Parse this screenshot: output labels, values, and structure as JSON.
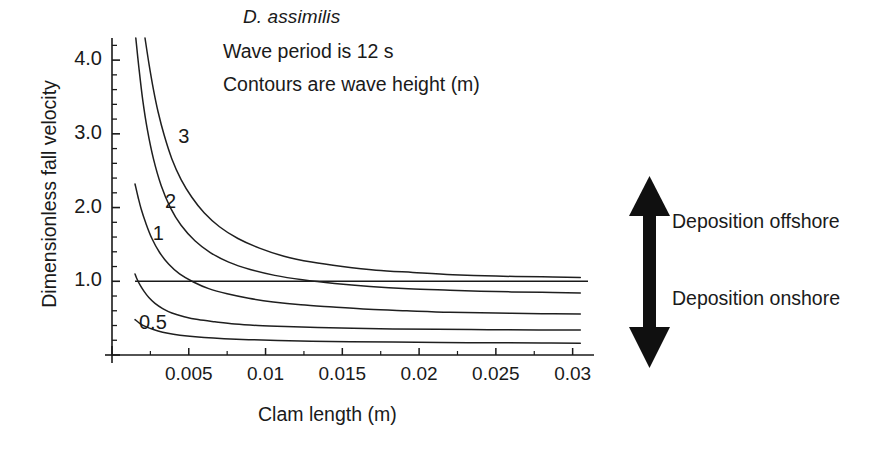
{
  "figure": {
    "title": "D. assimilis",
    "annotations": [
      "Wave period is 12 s",
      "Contours are wave height  (m)"
    ],
    "x_axis_title": "Clam length (m)",
    "y_axis_title": "Dimensionless fall velocity",
    "arrows": {
      "up_label": "Deposition offshore",
      "down_label": "Deposition onshore"
    }
  },
  "chart_data": {
    "type": "line",
    "title": "D. assimilis",
    "subtitle": "Wave period is 12 s | Contours are wave height  (m)",
    "xlabel": "Clam length (m)",
    "ylabel": "Dimensionless fall velocity",
    "xlim": [
      0.0,
      0.031
    ],
    "ylim": [
      0.0,
      4.3
    ],
    "x_ticks": [
      0.005,
      0.01,
      0.015,
      0.02,
      0.025,
      0.03
    ],
    "x_tick_labels": [
      "0.005",
      "0.01",
      "0.015",
      "0.02",
      "0.025",
      "0.03"
    ],
    "y_ticks": [
      1.0,
      2.0,
      3.0,
      4.0
    ],
    "y_tick_labels": [
      "1.0",
      "2.0",
      "3.0",
      "4.0"
    ],
    "x_minor_tick_step": 0.0025,
    "y_minor_tick_step": 0.2,
    "grid": false,
    "legend": "inline-contour-labels",
    "annotations": [
      {
        "text": "Wave period is 12 s",
        "x": 0.0075,
        "y": 3.85
      },
      {
        "text": "Contours are wave height  (m)",
        "x": 0.0075,
        "y": 3.45
      },
      {
        "text": "Deposition offshore",
        "x": 0.0385,
        "y": 1.85
      },
      {
        "text": "Deposition onshore",
        "x": 0.0385,
        "y": 0.8
      }
    ],
    "reference_lines": [
      {
        "orientation": "horizontal",
        "y": 1.0,
        "x_start": 0.0015,
        "x_end": 0.031,
        "label": "settling / suspension threshold"
      }
    ],
    "series": [
      {
        "name": "3",
        "label": "3",
        "label_position": {
          "x": 0.0047,
          "y": 2.95
        },
        "x": [
          0.00215,
          0.0024,
          0.0027,
          0.003,
          0.0034,
          0.0039,
          0.0045,
          0.0052,
          0.006,
          0.007,
          0.0082,
          0.0096,
          0.0112,
          0.013,
          0.015,
          0.0172,
          0.0196,
          0.0222,
          0.025,
          0.028,
          0.0305
        ],
        "y": [
          4.3,
          3.96,
          3.6,
          3.3,
          2.98,
          2.66,
          2.38,
          2.14,
          1.93,
          1.74,
          1.58,
          1.45,
          1.34,
          1.26,
          1.2,
          1.15,
          1.12,
          1.09,
          1.07,
          1.06,
          1.05
        ]
      },
      {
        "name": "2",
        "label": "2",
        "label_position": {
          "x": 0.00385,
          "y": 2.06
        },
        "x": [
          0.00155,
          0.00175,
          0.002,
          0.0023,
          0.0027,
          0.0032,
          0.0038,
          0.0045,
          0.0054,
          0.0064,
          0.0076,
          0.009,
          0.0106,
          0.0124,
          0.0145,
          0.0168,
          0.0193,
          0.022,
          0.025,
          0.028,
          0.0305
        ],
        "y": [
          4.3,
          3.9,
          3.46,
          3.06,
          2.66,
          2.3,
          2.0,
          1.76,
          1.55,
          1.39,
          1.26,
          1.16,
          1.08,
          1.02,
          0.97,
          0.93,
          0.9,
          0.88,
          0.86,
          0.85,
          0.84
        ]
      },
      {
        "name": "1",
        "label": "1",
        "label_position": {
          "x": 0.00305,
          "y": 1.63
        },
        "x": [
          0.0015,
          0.0017,
          0.0019,
          0.0022,
          0.0026,
          0.0031,
          0.0037,
          0.0044,
          0.0053,
          0.0063,
          0.0075,
          0.0089,
          0.0105,
          0.0123,
          0.0144,
          0.0167,
          0.0192,
          0.022,
          0.025,
          0.028,
          0.0305
        ],
        "y": [
          2.32,
          2.14,
          1.98,
          1.79,
          1.58,
          1.39,
          1.23,
          1.1,
          0.99,
          0.9,
          0.83,
          0.77,
          0.72,
          0.68,
          0.65,
          0.62,
          0.6,
          0.58,
          0.57,
          0.56,
          0.555
        ]
      },
      {
        "name": "0.5",
        "label": "0.5",
        "label_position": {
          "x": 0.00215,
          "y": 0.42
        },
        "x": [
          0.0015,
          0.00165,
          0.00185,
          0.0021,
          0.0024,
          0.0028,
          0.0033,
          0.0039,
          0.0047,
          0.0056,
          0.0067,
          0.008,
          0.0095,
          0.0113,
          0.0134,
          0.0157,
          0.0183,
          0.0212,
          0.0245,
          0.0278,
          0.0305
        ],
        "y": [
          1.1,
          1.02,
          0.94,
          0.86,
          0.78,
          0.7,
          0.63,
          0.57,
          0.52,
          0.48,
          0.45,
          0.42,
          0.4,
          0.385,
          0.372,
          0.362,
          0.354,
          0.348,
          0.343,
          0.34,
          0.338
        ]
      },
      {
        "name": "lowest",
        "label": "",
        "label_position": {
          "x": 0.0,
          "y": 0.0
        },
        "x": [
          0.0015,
          0.0018,
          0.0022,
          0.0027,
          0.0033,
          0.004,
          0.0049,
          0.006,
          0.0073,
          0.0089,
          0.0108,
          0.013,
          0.0155,
          0.0183,
          0.0214,
          0.0248,
          0.028,
          0.0305
        ],
        "y": [
          0.48,
          0.43,
          0.385,
          0.345,
          0.31,
          0.282,
          0.258,
          0.238,
          0.222,
          0.208,
          0.197,
          0.188,
          0.181,
          0.175,
          0.17,
          0.166,
          0.163,
          0.161
        ]
      }
    ]
  },
  "axes_geometry": {
    "plot_left_px": 112,
    "plot_right_px": 588,
    "plot_bottom_px": 355,
    "plot_top_px": 38,
    "x_value_at_left": 0.0,
    "x_value_at_right": 0.031,
    "y_value_at_bottom": 0.0,
    "y_value_at_top": 4.3
  },
  "y_tick_labels": [
    {
      "text": "4.0",
      "value": 4.0
    },
    {
      "text": "3.0",
      "value": 3.0
    },
    {
      "text": "2.0",
      "value": 2.0
    },
    {
      "text": "1.0",
      "value": 1.0
    }
  ],
  "x_tick_labels": [
    {
      "text": "0.005",
      "value": 0.005
    },
    {
      "text": "0.01",
      "value": 0.01
    },
    {
      "text": "0.015",
      "value": 0.015
    },
    {
      "text": "0.02",
      "value": 0.02
    },
    {
      "text": "0.025",
      "value": 0.025
    },
    {
      "text": "0.03",
      "value": 0.03
    }
  ],
  "colors": {
    "ink": "#1a1a1a",
    "curve": "#1f1f1f",
    "background": "#ffffff"
  }
}
